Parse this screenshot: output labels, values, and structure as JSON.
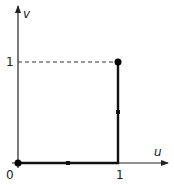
{
  "diagram": {
    "type": "path-in-unit-square",
    "axes": {
      "x_label": "u",
      "y_label": "v",
      "x_tick_label": "1",
      "y_tick_label": "1",
      "origin_label": "0"
    },
    "path": {
      "description": "Path from (0,0) to (1,0) then to (1,1)",
      "points": [
        [
          0,
          0
        ],
        [
          1,
          0
        ],
        [
          1,
          1
        ]
      ],
      "endpoints": [
        [
          0,
          0
        ],
        [
          1,
          1
        ]
      ],
      "direction_markers": [
        [
          0.5,
          0
        ],
        [
          1,
          0.5
        ]
      ]
    },
    "guides": {
      "dashed_line": {
        "from": [
          0,
          1
        ],
        "to": [
          1,
          1
        ]
      }
    },
    "colors": {
      "axis": "#222222",
      "path": "#111111",
      "dashed": "#333333",
      "background": "#ffffff"
    }
  }
}
